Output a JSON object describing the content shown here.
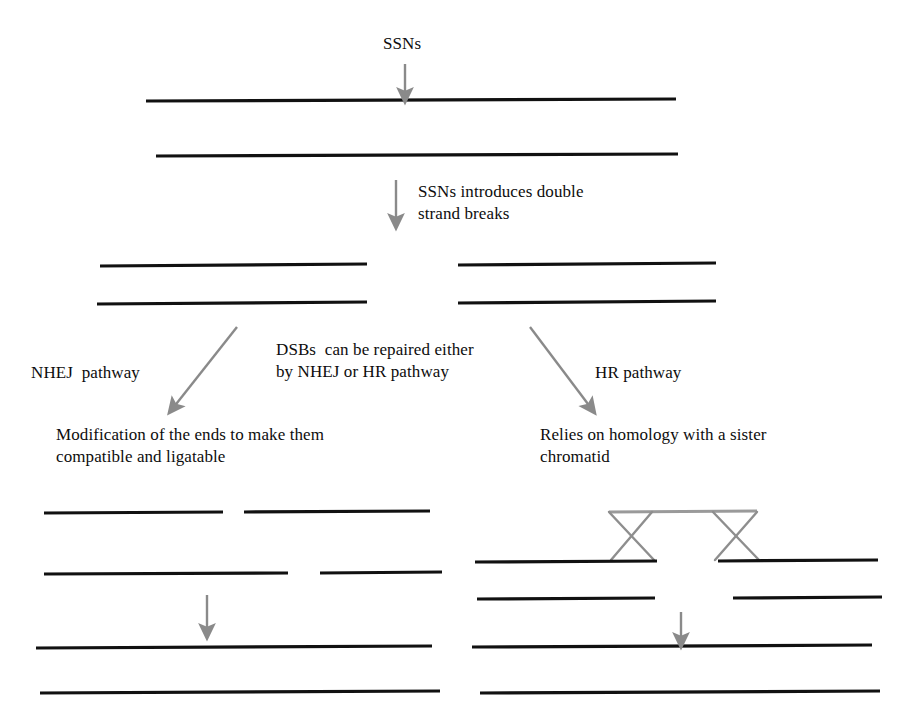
{
  "figure": {
    "title_label": "SSNs",
    "step_label": "SSNs introduces double\nstrand breaks",
    "branch_label": "DSBs  can be repaired either\nby NHEJ or HR pathway",
    "left_pathway_label": "NHEJ  pathway",
    "right_pathway_label": "HR pathway",
    "left_pathway_desc": "Modification of the ends to make them\ncompatible and ligatable",
    "right_pathway_desc": "Relies on homology with a sister\nchromatid"
  },
  "colors": {
    "dna_strand": "#111111",
    "arrow": "#8a8a8a",
    "crossover": "#8e8e8e",
    "background": "#ffffff",
    "text": "#0d0d0d"
  },
  "geometry": {
    "intact_dna": [
      {
        "name": "intact-strand-top",
        "x1": 146,
        "y1": 101,
        "x2": 676,
        "y2": 99
      },
      {
        "name": "intact-strand-bottom",
        "x1": 156,
        "y1": 156,
        "x2": 678,
        "y2": 154
      }
    ],
    "cut_dna": [
      {
        "name": "cut-left-top",
        "x1": 100,
        "y1": 266,
        "x2": 367,
        "y2": 264
      },
      {
        "name": "cut-right-top",
        "x1": 458,
        "y1": 265,
        "x2": 716,
        "y2": 263
      },
      {
        "name": "cut-left-bottom",
        "x1": 97,
        "y1": 304,
        "x2": 367,
        "y2": 302
      },
      {
        "name": "cut-right-bottom",
        "x1": 458,
        "y1": 303,
        "x2": 716,
        "y2": 301
      }
    ],
    "nhej_dna": [
      {
        "name": "nhej-top-left",
        "x1": 44,
        "y1": 513,
        "x2": 223,
        "y2": 512
      },
      {
        "name": "nhej-top-right",
        "x1": 244,
        "y1": 512,
        "x2": 430,
        "y2": 511
      },
      {
        "name": "nhej-bottom-left",
        "x1": 44,
        "y1": 574,
        "x2": 288,
        "y2": 573
      },
      {
        "name": "nhej-bottom-right",
        "x1": 320,
        "y1": 573,
        "x2": 442,
        "y2": 572
      },
      {
        "name": "nhej-repaired-top",
        "x1": 36,
        "y1": 648,
        "x2": 432,
        "y2": 646
      },
      {
        "name": "nhej-repaired-bottom",
        "x1": 40,
        "y1": 693,
        "x2": 440,
        "y2": 691
      }
    ],
    "hr_dna": [
      {
        "name": "hr-top-left",
        "x1": 475,
        "y1": 562,
        "x2": 657,
        "y2": 561
      },
      {
        "name": "hr-top-right",
        "x1": 718,
        "y1": 561,
        "x2": 878,
        "y2": 560
      },
      {
        "name": "hr-bottom-left",
        "x1": 477,
        "y1": 599,
        "x2": 655,
        "y2": 598
      },
      {
        "name": "hr-bottom-right",
        "x1": 733,
        "y1": 598,
        "x2": 882,
        "y2": 597
      },
      {
        "name": "hr-repaired-top",
        "x1": 472,
        "y1": 647,
        "x2": 872,
        "y2": 645
      },
      {
        "name": "hr-repaired-bottom",
        "x1": 480,
        "y1": 693,
        "x2": 880,
        "y2": 691
      }
    ],
    "crossovers": [
      {
        "name": "holliday-junction-left",
        "top_left": 609,
        "top_right": 652,
        "bottom_left": 611,
        "bottom_right": 654,
        "y_top": 512,
        "y_bottom": 560
      },
      {
        "name": "holliday-junction-right",
        "top_left": 713,
        "top_right": 757,
        "bottom_left": 715,
        "bottom_right": 759,
        "y_top": 512,
        "y_bottom": 560
      }
    ],
    "crossover_bridge": {
      "name": "homologous-template-strand",
      "x1": 609,
      "y1": 512,
      "x2": 757,
      "y2": 511
    },
    "arrows": [
      {
        "name": "arrow-ssn-cut",
        "x1": 405,
        "y1": 64,
        "x2": 405,
        "y2": 99
      },
      {
        "name": "arrow-dsb-formation",
        "x1": 396,
        "y1": 180,
        "x2": 396,
        "y2": 225
      },
      {
        "name": "arrow-to-nhej",
        "x1": 237,
        "y1": 327,
        "x2": 170,
        "y2": 412
      },
      {
        "name": "arrow-to-hr",
        "x1": 530,
        "y1": 327,
        "x2": 594,
        "y2": 412
      },
      {
        "name": "arrow-nhej-ligation",
        "x1": 207,
        "y1": 595,
        "x2": 207,
        "y2": 636
      },
      {
        "name": "arrow-hr-resolution",
        "x1": 681,
        "y1": 612,
        "x2": 681,
        "y2": 645
      }
    ]
  }
}
